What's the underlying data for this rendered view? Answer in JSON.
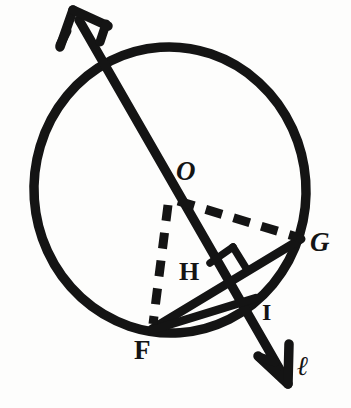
{
  "figure": {
    "stroke_color": "#141414",
    "background_color": "#fdfdfc",
    "circle": {
      "name": "circle-o",
      "center_label": "O",
      "cx": 170,
      "cy": 190,
      "rx": 136,
      "ry": 143,
      "stroke_width": 9
    },
    "points": [
      {
        "id": "O",
        "label": "O",
        "x": 172,
        "y": 196,
        "role": "center"
      },
      {
        "id": "G",
        "label": "G",
        "x": 299,
        "y": 238,
        "role": "on-circle"
      },
      {
        "id": "F",
        "label": "F",
        "x": 152,
        "y": 329,
        "role": "on-circle"
      },
      {
        "id": "H",
        "label": "H",
        "x": 224,
        "y": 283,
        "role": "foot-of-perpendicular"
      },
      {
        "id": "I",
        "label": "I",
        "x": 249,
        "y": 306,
        "role": "intersection"
      },
      {
        "id": "l",
        "label": "ℓ",
        "x": 305,
        "y": 370,
        "role": "line-name"
      }
    ],
    "segments": [
      {
        "id": "arrow-line",
        "name": "line-l-arrow",
        "style": "solid",
        "from": "top-arrow-tip",
        "to": "bottom-arrow-tip",
        "x1": 78,
        "y1": 18,
        "x2": 284,
        "y2": 377
      },
      {
        "id": "FG",
        "name": "chord-fg",
        "style": "solid",
        "from": "F",
        "to": "G",
        "x1": 152,
        "y1": 329,
        "x2": 299,
        "y2": 238
      },
      {
        "id": "FI",
        "name": "segment-fi",
        "style": "solid",
        "from": "F",
        "to": "I",
        "x1": 152,
        "y1": 329,
        "x2": 253,
        "y2": 300
      },
      {
        "id": "OG",
        "name": "radius-og-dashed",
        "style": "dashed",
        "from": "O",
        "to": "G",
        "x1": 176,
        "y1": 200,
        "x2": 296,
        "y2": 236
      },
      {
        "id": "OF",
        "name": "radius-of-dashed",
        "style": "dashed",
        "from": "O",
        "to": "F",
        "x1": 169,
        "y1": 203,
        "x2": 153,
        "y2": 325
      }
    ],
    "right_angle": {
      "name": "right-angle-mark-at-h",
      "vertex": "H",
      "x": 224,
      "y": 283,
      "size": 22
    },
    "arrows": [
      {
        "name": "arrowhead-top",
        "tip_x": 73,
        "tip_y": 10,
        "direction": "up-left"
      },
      {
        "name": "arrowhead-bottom",
        "tip_x": 288,
        "tip_y": 382,
        "direction": "down-right"
      }
    ],
    "labels": {
      "O": "O",
      "G": "G",
      "H": "H",
      "I": "I",
      "F": "F",
      "l": "ℓ"
    }
  }
}
